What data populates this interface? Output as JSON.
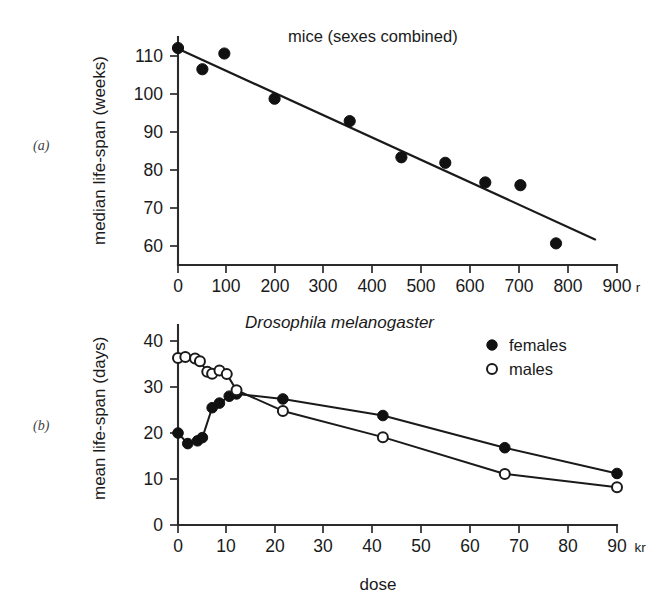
{
  "figure": {
    "panel_a_label": "(a)",
    "panel_b_label": "(b)",
    "bottom_axis_caption": "dose"
  },
  "chart_data": [
    {
      "type": "scatter",
      "panel": "(a)",
      "title": "mice (sexes combined)",
      "xlabel": "",
      "ylabel": "median life-span (weeks)",
      "x_unit": "r",
      "xlim": [
        0,
        900
      ],
      "ylim": [
        55,
        113
      ],
      "xticks": [
        0,
        100,
        200,
        300,
        400,
        500,
        600,
        700,
        800,
        900
      ],
      "xticklabels": [
        "0",
        "100",
        "200",
        "300",
        "400",
        "500",
        "600",
        "700",
        "800",
        "900"
      ],
      "yticks": [
        60,
        70,
        80,
        90,
        100,
        110
      ],
      "yticklabels": [
        "60",
        "70",
        "80",
        "90",
        "100",
        "110"
      ],
      "grid": false,
      "legend": "none",
      "series": [
        {
          "name": "mice (sexes combined)",
          "marker": "filled-circle",
          "x": [
            0,
            50,
            95,
            198,
            352,
            458,
            548,
            630,
            702,
            775
          ],
          "y": [
            110.2,
            104.8,
            108.8,
            97.3,
            91.6,
            82.4,
            81.0,
            76.0,
            75.3,
            60.5
          ]
        }
      ],
      "fit_line": {
        "label": "regression line",
        "x": [
          0,
          855
        ],
        "y": [
          110.0,
          61.5
        ]
      }
    },
    {
      "type": "line",
      "panel": "(b)",
      "title": "Drosophila melanogaster",
      "xlabel": "dose",
      "ylabel": "mean life-span (days)",
      "x_unit": "kr",
      "xlim": [
        0,
        90
      ],
      "ylim": [
        0,
        42
      ],
      "xticks": [
        0,
        10,
        20,
        30,
        40,
        50,
        60,
        70,
        80,
        90
      ],
      "xticklabels": [
        "0",
        "10",
        "20",
        "30",
        "40",
        "50",
        "60",
        "70",
        "80",
        "90"
      ],
      "yticks": [
        0,
        10,
        20,
        30,
        40
      ],
      "yticklabels": [
        "0",
        "10",
        "20",
        "30",
        "40"
      ],
      "grid": false,
      "legend": "top-right",
      "series": [
        {
          "name": "females",
          "marker": "filled-circle",
          "x": [
            0,
            2.0,
            4.0,
            5.0,
            7.0,
            8.5,
            10.5,
            12.0,
            21.5,
            42.0,
            67.0,
            90.0
          ],
          "y": [
            20.0,
            17.7,
            18.3,
            19.0,
            25.5,
            26.5,
            28.0,
            28.5,
            27.4,
            23.8,
            16.8,
            11.2
          ]
        },
        {
          "name": "males",
          "marker": "open-circle",
          "x": [
            0,
            1.5,
            3.5,
            4.5,
            6.0,
            7.0,
            8.5,
            10.0,
            12.0,
            21.5,
            42.0,
            67.0,
            90.0
          ],
          "y": [
            36.3,
            36.5,
            36.2,
            35.6,
            33.3,
            32.9,
            33.6,
            32.8,
            29.3,
            24.8,
            19.1,
            11.1,
            8.2
          ]
        }
      ]
    }
  ],
  "legend": {
    "entries": [
      {
        "label": "females",
        "marker": "filled-circle"
      },
      {
        "label": "males",
        "marker": "open-circle"
      }
    ]
  }
}
